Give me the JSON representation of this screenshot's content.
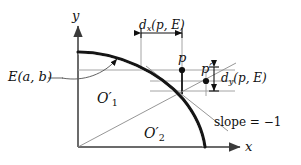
{
  "figure": {
    "axes": {
      "y_label": "y",
      "x_label": "x"
    },
    "curve_label_main": "E",
    "curve_label_args": "(a, b)",
    "regions": [
      {
        "base": "O",
        "prime": "′",
        "sub": "1"
      },
      {
        "base": "O",
        "prime": "′",
        "sub": "2"
      }
    ],
    "points": [
      {
        "label": "p"
      },
      {
        "label": "p",
        "prime": "′"
      }
    ],
    "distances": {
      "dx": {
        "base": "d",
        "sub": "x",
        "args": "(p, E)"
      },
      "dy": {
        "base": "d",
        "sub": "y",
        "args": "(p, E)"
      }
    },
    "slope_text": "slope = −1",
    "colors": {
      "ink": "#101010",
      "curve": "#1a1a1a",
      "guide": "#8a8a8a",
      "axis": "#6f6f6f"
    }
  }
}
